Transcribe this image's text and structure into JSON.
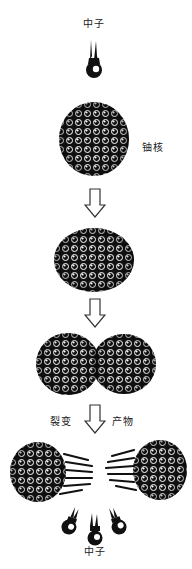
{
  "diagram": {
    "type": "process-flow",
    "topic": "nuclear fission",
    "labels": {
      "neutron_top": "中子",
      "nucleus": "铀核",
      "fission": "裂变",
      "products": "产物",
      "neutron_bottom": "中子"
    },
    "stages": [
      {
        "id": "incoming-neutron",
        "label": "中子"
      },
      {
        "id": "uranium-nucleus",
        "label": "铀核"
      },
      {
        "id": "excited-nucleus"
      },
      {
        "id": "deformed-nucleus"
      },
      {
        "id": "fission-products",
        "label": "裂变 产物"
      },
      {
        "id": "released-neutrons",
        "label": "中子",
        "count": 3
      }
    ],
    "arrows": 3,
    "colors": {
      "ink": "#111111",
      "background": "#ffffff",
      "arrow_stroke": "#333333"
    }
  }
}
